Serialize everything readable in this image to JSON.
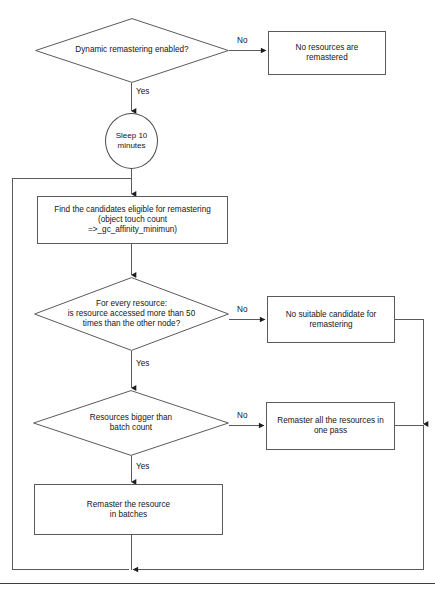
{
  "diagram": {
    "line_color": "#5a5a5a",
    "text_color": "#151515",
    "background": "#ffffff"
  },
  "nodes": {
    "decision_dynamic_remastering": {
      "label": "Dynamic remastering enabled?",
      "shape": "diamond"
    },
    "terminal_no_resources": {
      "label": "No resources are\nremastered",
      "shape": "rectangle"
    },
    "process_sleep": {
      "label": "Sleep 10\nminutes",
      "shape": "ellipse"
    },
    "process_find_candidates": {
      "label": "Find the candidates eligible for remastering\n(object touch count\n=>_gc_affinity_minimun)",
      "shape": "rectangle"
    },
    "decision_every_resource": {
      "label": "For every resource:\nis resource accessed more than 50\ntimes than the other node?",
      "shape": "diamond"
    },
    "terminal_no_candidate": {
      "label": "No suitable candidate for\nremastering",
      "shape": "rectangle"
    },
    "decision_batch_count": {
      "label": "Resources bigger than\nbatch count",
      "shape": "diamond"
    },
    "process_remaster_one_pass": {
      "label": "Remaster all the resources in\none pass",
      "shape": "rectangle"
    },
    "process_remaster_batches": {
      "label": "Remaster the resource\nin batches",
      "shape": "rectangle"
    }
  },
  "edge_labels": {
    "dynamic_no": "No",
    "dynamic_yes": "Yes",
    "resource_no": "No",
    "resource_yes": "Yes",
    "batch_no": "No",
    "batch_yes": "Yes"
  }
}
